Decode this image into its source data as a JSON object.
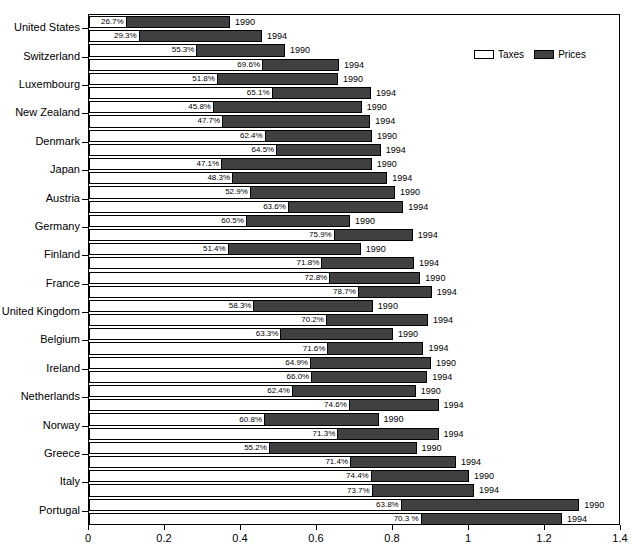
{
  "chart_data": {
    "type": "bar",
    "orientation": "horizontal",
    "stacked": true,
    "title": "",
    "subtitle": "",
    "xlabel": "",
    "ylabel": "",
    "xlim": [
      0,
      1.4
    ],
    "xticks": [
      "0",
      "0.2",
      "0.4",
      "0.6",
      "0.8",
      "1",
      "1.2",
      "1.4"
    ],
    "xtick_values": [
      0,
      0.2,
      0.4,
      0.6,
      0.8,
      1.0,
      1.2,
      1.4
    ],
    "grid": false,
    "legend": {
      "position": "top-right",
      "entries": [
        {
          "label": "Taxes",
          "color": "#ffffff"
        },
        {
          "label": "Prices",
          "color": "#404040"
        }
      ]
    },
    "series": [
      {
        "name": "Taxes",
        "color": "#ffffff"
      },
      {
        "name": "Prices",
        "color": "#404040"
      }
    ],
    "categories": [
      "United States",
      "Switzerland",
      "Luxembourg",
      "New Zealand",
      "Denmark",
      "Japan",
      "Austria",
      "Germany",
      "Finland",
      "France",
      "United Kingdom",
      "Belgium",
      "Ireland",
      "Netherlands",
      "Norway",
      "Greece",
      "Italy",
      "Portugal"
    ],
    "groups": [
      "1990",
      "1994"
    ],
    "rows": [
      {
        "country": "United States",
        "year": "1990",
        "tax_share": "26.7%",
        "tax_share_value": 26.7,
        "total": 0.371
      },
      {
        "country": "United States",
        "year": "1994",
        "tax_share": "29.3%",
        "tax_share_value": 29.3,
        "total": 0.455
      },
      {
        "country": "Switzerland",
        "year": "1990",
        "tax_share": "55.3%",
        "tax_share_value": 55.3,
        "total": 0.516
      },
      {
        "country": "Switzerland",
        "year": "1994",
        "tax_share": "69.6%",
        "tax_share_value": 69.6,
        "total": 0.658
      },
      {
        "country": "Luxembourg",
        "year": "1990",
        "tax_share": "51.8%",
        "tax_share_value": 51.8,
        "total": 0.655
      },
      {
        "country": "Luxembourg",
        "year": "1994",
        "tax_share": "65.1%",
        "tax_share_value": 65.1,
        "total": 0.742
      },
      {
        "country": "New Zealand",
        "year": "1990",
        "tax_share": "45.8%",
        "tax_share_value": 45.8,
        "total": 0.718
      },
      {
        "country": "New Zealand",
        "year": "1994",
        "tax_share": "47.7%",
        "tax_share_value": 47.7,
        "total": 0.74
      },
      {
        "country": "Denmark",
        "year": "1990",
        "tax_share": "62.4%",
        "tax_share_value": 62.4,
        "total": 0.745
      },
      {
        "country": "Denmark",
        "year": "1994",
        "tax_share": "64.5%",
        "tax_share_value": 64.5,
        "total": 0.768
      },
      {
        "country": "Japan",
        "year": "1990",
        "tax_share": "47.1%",
        "tax_share_value": 47.1,
        "total": 0.744
      },
      {
        "country": "Japan",
        "year": "1994",
        "tax_share": "48.3%",
        "tax_share_value": 48.3,
        "total": 0.785
      },
      {
        "country": "Austria",
        "year": "1990",
        "tax_share": "52.9%",
        "tax_share_value": 52.9,
        "total": 0.805
      },
      {
        "country": "Austria",
        "year": "1994",
        "tax_share": "63.6%",
        "tax_share_value": 63.6,
        "total": 0.827
      },
      {
        "country": "Germany",
        "year": "1990",
        "tax_share": "60.5%",
        "tax_share_value": 60.5,
        "total": 0.687
      },
      {
        "country": "Germany",
        "year": "1994",
        "tax_share": "75.9%",
        "tax_share_value": 75.9,
        "total": 0.852
      },
      {
        "country": "Finland",
        "year": "1990",
        "tax_share": "51.4%",
        "tax_share_value": 51.4,
        "total": 0.715
      },
      {
        "country": "Finland",
        "year": "1994",
        "tax_share": "71.8%",
        "tax_share_value": 71.8,
        "total": 0.855
      },
      {
        "country": "France",
        "year": "1990",
        "tax_share": "72.8%",
        "tax_share_value": 72.8,
        "total": 0.872
      },
      {
        "country": "France",
        "year": "1994",
        "tax_share": "78.7%",
        "tax_share_value": 78.7,
        "total": 0.902
      },
      {
        "country": "United Kingdom",
        "year": "1990",
        "tax_share": "58.3%",
        "tax_share_value": 58.3,
        "total": 0.747
      },
      {
        "country": "United Kingdom",
        "year": "1994",
        "tax_share": "70.2%",
        "tax_share_value": 70.2,
        "total": 0.892
      },
      {
        "country": "Belgium",
        "year": "1990",
        "tax_share": "63.3%",
        "tax_share_value": 63.3,
        "total": 0.8
      },
      {
        "country": "Belgium",
        "year": "1994",
        "tax_share": "71.6%",
        "tax_share_value": 71.6,
        "total": 0.88
      },
      {
        "country": "Ireland",
        "year": "1990",
        "tax_share": "64.9%",
        "tax_share_value": 64.9,
        "total": 0.9
      },
      {
        "country": "Ireland",
        "year": "1994",
        "tax_share": "66.0%",
        "tax_share_value": 66.0,
        "total": 0.89
      },
      {
        "country": "Netherlands",
        "year": "1990",
        "tax_share": "62.4%",
        "tax_share_value": 62.4,
        "total": 0.86
      },
      {
        "country": "Netherlands",
        "year": "1994",
        "tax_share": "74.6%",
        "tax_share_value": 74.6,
        "total": 0.92
      },
      {
        "country": "Norway",
        "year": "1990",
        "tax_share": "60.8%",
        "tax_share_value": 60.8,
        "total": 0.762
      },
      {
        "country": "Norway",
        "year": "1994",
        "tax_share": "71.3%",
        "tax_share_value": 71.3,
        "total": 0.92
      },
      {
        "country": "Greece",
        "year": "1990",
        "tax_share": "55.2%",
        "tax_share_value": 55.2,
        "total": 0.862
      },
      {
        "country": "Greece",
        "year": "1994",
        "tax_share": "71.4%",
        "tax_share_value": 71.4,
        "total": 0.966
      },
      {
        "country": "Italy",
        "year": "1990",
        "tax_share": "74.4%",
        "tax_share_value": 74.4,
        "total": 1.0
      },
      {
        "country": "Italy",
        "year": "1994",
        "tax_share": "73.7%",
        "tax_share_value": 73.7,
        "total": 1.013
      },
      {
        "country": "Portugal",
        "year": "1990",
        "tax_share": "63.8%",
        "tax_share_value": 63.8,
        "total": 1.29
      },
      {
        "country": "Portugal",
        "year": "1994",
        "tax_share": "70.3 %",
        "tax_share_value": 70.3,
        "total": 1.245
      }
    ]
  }
}
